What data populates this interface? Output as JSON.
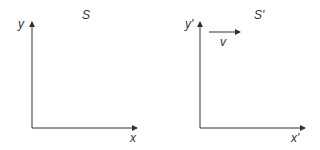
{
  "diagram": {
    "frames": [
      {
        "name": "S",
        "frame_label": "S",
        "y_label": "y",
        "x_label": "x"
      },
      {
        "name": "S'",
        "frame_label": "S'",
        "y_label": "y'",
        "x_label": "x'",
        "velocity_label": "v"
      }
    ],
    "colors": {
      "ink": "#333333",
      "background": "#ffffff"
    }
  }
}
